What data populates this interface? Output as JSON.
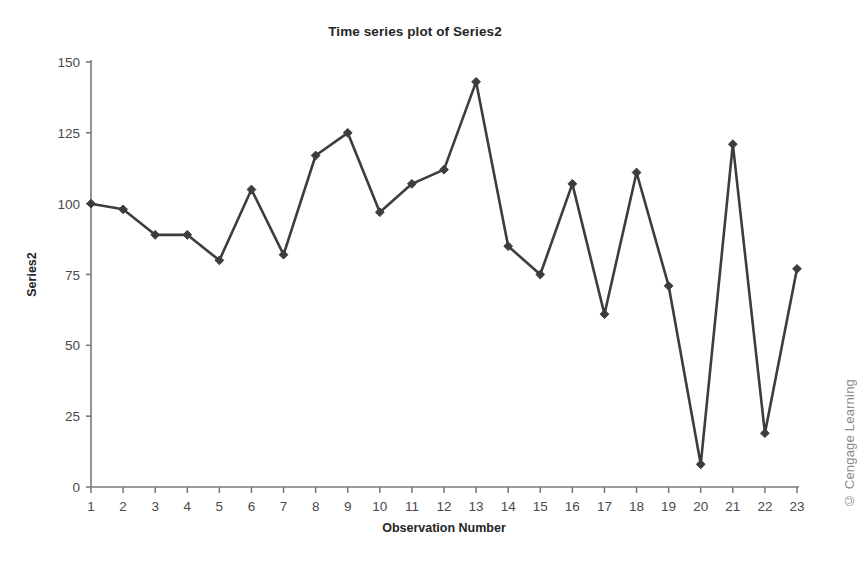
{
  "chart_data": {
    "type": "line",
    "title": "Time series plot of Series2",
    "xlabel": "Observation Number",
    "ylabel": "Series2",
    "x": [
      1,
      2,
      3,
      4,
      5,
      6,
      7,
      8,
      9,
      10,
      11,
      12,
      13,
      14,
      15,
      16,
      17,
      18,
      19,
      20,
      21,
      22,
      23
    ],
    "values": [
      100,
      98,
      89,
      89,
      80,
      105,
      82,
      117,
      125,
      97,
      107,
      112,
      143,
      85,
      75,
      107,
      61,
      111,
      71,
      8,
      121,
      19,
      77
    ],
    "series": [
      {
        "name": "Series2",
        "values": [
          100,
          98,
          89,
          89,
          80,
          105,
          82,
          117,
          125,
          97,
          107,
          112,
          143,
          85,
          75,
          107,
          61,
          111,
          71,
          8,
          121,
          19,
          77
        ]
      }
    ],
    "xtick_labels": [
      "1",
      "2",
      "3",
      "4",
      "5",
      "6",
      "7",
      "8",
      "9",
      "10",
      "11",
      "12",
      "13",
      "14",
      "15",
      "16",
      "17",
      "18",
      "19",
      "20",
      "21",
      "22",
      "23"
    ],
    "ytick_labels": [
      "0",
      "25",
      "50",
      "75",
      "100",
      "125",
      "150"
    ],
    "yticks": [
      0,
      25,
      50,
      75,
      100,
      125,
      150
    ],
    "ylim": [
      0,
      150
    ],
    "xlim": [
      1,
      23
    ],
    "grid": false,
    "legend": false,
    "marker": "diamond",
    "line_color": "#3d3d3d",
    "marker_color": "#3d3d3d",
    "axis_color": "#7a7a7a"
  },
  "credit": "© Cengage Learning"
}
